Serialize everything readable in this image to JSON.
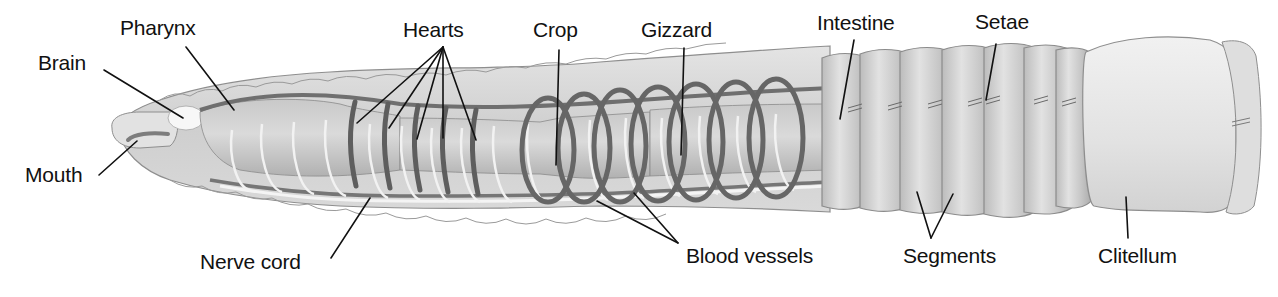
{
  "figure": {
    "colors": {
      "background": "#ffffff",
      "label_text": "#111111",
      "leader_line": "#111111",
      "body_outer": "#d6d6d6",
      "body_outline": "#8e8e8e",
      "gut": "#bdbdbd",
      "blood_vessel": "#6f6f6f",
      "nerve": "#f4f4f4",
      "clitellum": "#e6e6e6"
    }
  },
  "labels": [
    {
      "id": "brain",
      "text": "Brain",
      "x": 38,
      "y": 52
    },
    {
      "id": "pharynx",
      "text": "Pharynx",
      "x": 120,
      "y": 17
    },
    {
      "id": "mouth",
      "text": "Mouth",
      "x": 25,
      "y": 164
    },
    {
      "id": "hearts",
      "text": "Hearts",
      "x": 403,
      "y": 19
    },
    {
      "id": "crop",
      "text": "Crop",
      "x": 533,
      "y": 19
    },
    {
      "id": "gizzard",
      "text": "Gizzard",
      "x": 641,
      "y": 19
    },
    {
      "id": "intestine",
      "text": "Intestine",
      "x": 817,
      "y": 12
    },
    {
      "id": "setae",
      "text": "Setae",
      "x": 975,
      "y": 11
    },
    {
      "id": "nerve_cord",
      "text": "Nerve cord",
      "x": 200,
      "y": 251
    },
    {
      "id": "blood_vessels",
      "text": "Blood vessels",
      "x": 686,
      "y": 245
    },
    {
      "id": "segments",
      "text": "Segments",
      "x": 903,
      "y": 245
    },
    {
      "id": "clitellum",
      "text": "Clitellum",
      "x": 1098,
      "y": 245
    }
  ]
}
